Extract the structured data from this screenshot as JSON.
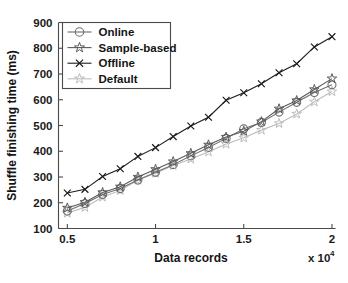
{
  "chart_data": {
    "type": "line",
    "title": "",
    "xlabel": "Data records",
    "ylabel": "Shuffle finishing time (ms)",
    "x_multiplier_text": "x 10",
    "x_multiplier_exp": "4",
    "xlim": [
      0.45,
      2.02
    ],
    "ylim": [
      100,
      900
    ],
    "xticks": [
      0.5,
      1,
      1.5,
      2
    ],
    "xtick_labels": [
      "0.5",
      "1",
      "1.5",
      "2"
    ],
    "yticks": [
      100,
      200,
      300,
      400,
      500,
      600,
      700,
      800,
      900
    ],
    "ytick_labels": [
      "100",
      "200",
      "300",
      "400",
      "500",
      "600",
      "700",
      "800",
      "900"
    ],
    "grid": false,
    "legend_position": "upper-left",
    "x": [
      0.5,
      0.6,
      0.7,
      0.8,
      0.9,
      1.0,
      1.1,
      1.2,
      1.3,
      1.4,
      1.5,
      1.6,
      1.7,
      1.8,
      1.9,
      2.0
    ],
    "series": [
      {
        "name": "Online",
        "marker": "circle",
        "color": "#6e6e6e",
        "values": [
          168,
          197,
          232,
          255,
          288,
          318,
          348,
          382,
          415,
          450,
          487,
          512,
          552,
          590,
          628,
          658
        ]
      },
      {
        "name": "Sample-based",
        "marker": "star",
        "color": "#5a5a5a",
        "values": [
          180,
          202,
          240,
          262,
          300,
          330,
          360,
          392,
          425,
          455,
          478,
          515,
          565,
          597,
          640,
          682
        ]
      },
      {
        "name": "Offline",
        "marker": "x",
        "color": "#1c1c1c",
        "values": [
          238,
          252,
          302,
          332,
          380,
          414,
          457,
          498,
          532,
          598,
          627,
          662,
          705,
          740,
          805,
          845
        ]
      },
      {
        "name": "Default",
        "marker": "star",
        "color": "#bdbdbd",
        "values": [
          160,
          182,
          222,
          248,
          288,
          315,
          345,
          370,
          398,
          428,
          452,
          482,
          508,
          545,
          592,
          632
        ]
      }
    ]
  },
  "legend": {
    "entries": [
      {
        "label": "Online"
      },
      {
        "label": "Sample-based"
      },
      {
        "label": "Offline"
      },
      {
        "label": "Default"
      }
    ]
  },
  "colors": {
    "axis": "#4a4a4a",
    "text": "#141414",
    "background": "#ffffff"
  }
}
